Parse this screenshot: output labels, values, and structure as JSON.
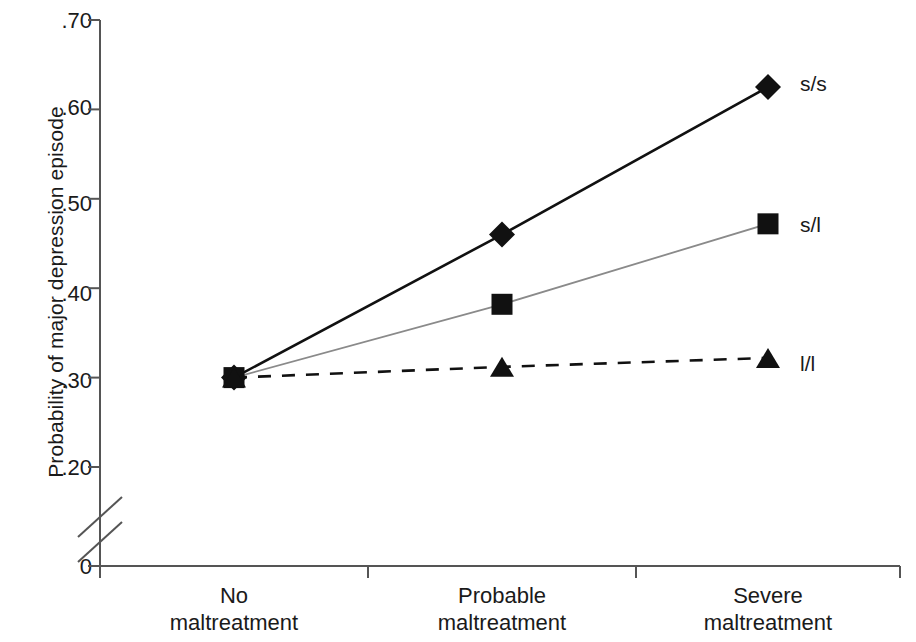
{
  "chart_data": {
    "type": "line",
    "title": "",
    "subtitle": "",
    "xlabel": "",
    "ylabel": "Probability of major depression episode",
    "categories": [
      "No maltreatment",
      "Probable maltreatment",
      "Severe maltreatment"
    ],
    "category_lines": [
      [
        "No",
        "maltreatment"
      ],
      [
        "Probable",
        "maltreatment"
      ],
      [
        "Severe",
        "maltreatment"
      ]
    ],
    "ylim": [
      0.2,
      0.7
    ],
    "y_axis_break": true,
    "y_axis_break_note": "axis break between 0 and .20",
    "yticks": [
      {
        "value": 0.7,
        "label": ".70"
      },
      {
        "value": 0.6,
        "label": ".60"
      },
      {
        "value": 0.5,
        "label": ".50"
      },
      {
        "value": 0.4,
        "label": ".40"
      },
      {
        "value": 0.3,
        "label": ".30"
      },
      {
        "value": 0.2,
        "label": ".20"
      },
      {
        "value": 0.0,
        "label": "0"
      }
    ],
    "grid": false,
    "legend_position": "right-of-line-ends",
    "series": [
      {
        "name": "s/s",
        "values": [
          0.3,
          0.46,
          0.625
        ],
        "marker": "diamond",
        "line_style": "solid",
        "color": "#111111",
        "line_width": 2.6
      },
      {
        "name": "s/l",
        "values": [
          0.3,
          0.382,
          0.472
        ],
        "marker": "square",
        "line_style": "solid",
        "color": "#8a8a8a",
        "marker_color": "#111111",
        "line_width": 1.8
      },
      {
        "name": "l/l",
        "values": [
          0.3,
          0.312,
          0.322
        ],
        "marker": "triangle",
        "line_style": "dashed",
        "color": "#111111",
        "line_width": 2.6
      }
    ]
  },
  "legend": {
    "items": [
      {
        "label": "s/s"
      },
      {
        "label": "s/l"
      },
      {
        "label": "l/l"
      }
    ]
  },
  "axes": {
    "y_axis_label": "Probability of major depression episode",
    "y_tick_labels": [
      ".70",
      ".60",
      ".50",
      ".40",
      ".30",
      ".20",
      "0"
    ],
    "x_tick_labels": [
      "No maltreatment",
      "Probable maltreatment",
      "Severe maltreatment"
    ]
  },
  "colors": {
    "axis": "#555555",
    "series_ss": "#111111",
    "series_sl": "#8a8a8a",
    "series_ll": "#111111",
    "background": "#ffffff",
    "text": "#1a1a1a"
  }
}
